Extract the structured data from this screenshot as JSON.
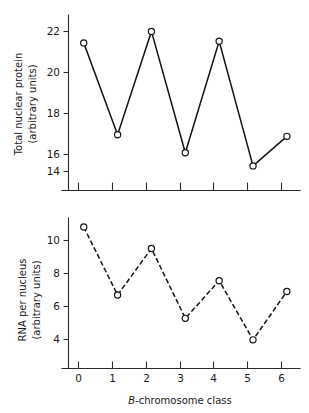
{
  "figure": {
    "background_color": "#ffffff",
    "ink_color": "#141414"
  },
  "chart_data": [
    {
      "type": "line",
      "title": "",
      "panel": "top",
      "xlabel": "",
      "ylabel": "Total nuclear protein (arbitrary units)",
      "ylabel_line1": "Total nuclear protein",
      "ylabel_line2": "(arbitrary units)",
      "x": [
        0,
        1,
        2,
        3,
        4,
        5,
        6
      ],
      "categories": [
        "0",
        "1",
        "2",
        "3",
        "4",
        "5",
        "6"
      ],
      "values": [
        21.9,
        16.3,
        22.6,
        15.2,
        22.0,
        14.4,
        16.2
      ],
      "xtick_labels": [
        "",
        "",
        "",
        "",
        "",
        "",
        ""
      ],
      "ytick_labels": [
        "14",
        "16",
        "18",
        "20",
        "22"
      ],
      "yticks": [
        14,
        16,
        18,
        20,
        22
      ],
      "ylim": [
        12.9,
        23.6
      ],
      "xlim": [
        -0.45,
        6.55
      ],
      "grid": false,
      "legend": "none",
      "line_style": "solid",
      "marker": "open-circle"
    },
    {
      "type": "line",
      "title": "",
      "panel": "bottom",
      "xlabel": "B-chromosome class",
      "xlabel_italic_prefix": "B",
      "xlabel_rest": "-chromosome class",
      "ylabel": "RNA per nucleus (arbitrary units)",
      "ylabel_line1": "RNA per nucleus",
      "ylabel_line2": "(arbitrary units)",
      "x": [
        0,
        1,
        2,
        3,
        4,
        5,
        6
      ],
      "categories": [
        "0",
        "1",
        "2",
        "3",
        "4",
        "5",
        "6"
      ],
      "values": [
        10.9,
        7.1,
        9.7,
        5.8,
        7.9,
        4.6,
        7.3
      ],
      "xtick_labels": [
        "0",
        "1",
        "2",
        "3",
        "4",
        "5",
        "6"
      ],
      "ytick_labels": [
        "4",
        "6",
        "8",
        "10"
      ],
      "yticks": [
        4,
        6,
        8,
        10
      ],
      "ylim": [
        3.0,
        11.4
      ],
      "xlim": [
        -0.45,
        6.55
      ],
      "grid": false,
      "legend": "none",
      "line_style": "dashed",
      "marker": "open-circle"
    }
  ]
}
